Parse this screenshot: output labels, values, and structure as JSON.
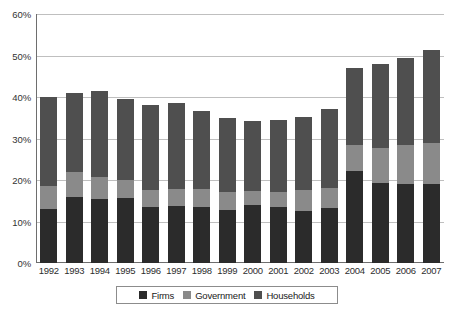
{
  "chart_data": {
    "type": "bar",
    "stacked": true,
    "title": "",
    "subtitle": "",
    "xlabel": "",
    "ylabel": "",
    "ylim": [
      0,
      60
    ],
    "ytick_labels": [
      "0%",
      "10%",
      "20%",
      "30%",
      "40%",
      "50%",
      "60%"
    ],
    "ytick_values": [
      0,
      10,
      20,
      30,
      40,
      50,
      60
    ],
    "grid": true,
    "grid_axis": "y",
    "legend_position": "bottom-center",
    "categories": [
      "1992",
      "1993",
      "1994",
      "1995",
      "1996",
      "1997",
      "1998",
      "1999",
      "2000",
      "2001",
      "2002",
      "2003",
      "2004",
      "2005",
      "2006",
      "2007"
    ],
    "series": [
      {
        "name": "Firms",
        "color": "#2b2b2b",
        "values": [
          13.0,
          15.8,
          15.4,
          15.6,
          13.6,
          13.7,
          13.5,
          12.8,
          13.9,
          13.4,
          12.6,
          13.3,
          22.1,
          19.2,
          19.0,
          19.0
        ]
      },
      {
        "name": "Government",
        "color": "#8a8a8a",
        "values": [
          5.6,
          6.2,
          5.4,
          4.3,
          3.9,
          4.2,
          4.3,
          4.3,
          3.4,
          3.8,
          5.0,
          4.7,
          6.3,
          8.6,
          9.4,
          10.0
        ]
      },
      {
        "name": "Households",
        "color": "#4f4f4f",
        "values": [
          21.4,
          19.0,
          20.6,
          19.6,
          20.5,
          20.6,
          18.8,
          17.9,
          17.0,
          17.3,
          17.7,
          19.2,
          18.5,
          20.2,
          20.9,
          22.4
        ]
      }
    ],
    "totals": [
      40.0,
      41.0,
      41.4,
      39.5,
      38.0,
      38.5,
      36.6,
      35.0,
      34.3,
      34.5,
      35.3,
      37.2,
      46.9,
      48.0,
      49.3,
      51.4
    ]
  },
  "legend": {
    "items": [
      {
        "label": "Firms",
        "color": "#2b2b2b"
      },
      {
        "label": "Government",
        "color": "#8a8a8a"
      },
      {
        "label": "Households",
        "color": "#4f4f4f"
      }
    ]
  },
  "axes": {
    "axis_color": "#6e6e6e",
    "grid_color": "#bfbfbf"
  }
}
